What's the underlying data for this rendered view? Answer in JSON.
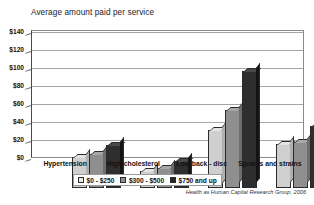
{
  "chart_data": {
    "type": "bar",
    "title": "Average amount paid per service",
    "xlabel": "",
    "ylabel": "",
    "ylim": [
      0,
      140
    ],
    "ytick_labels": [
      "$140",
      "$120",
      "$100",
      "$80",
      "$60",
      "$40",
      "$20",
      "$0"
    ],
    "ytick_values": [
      140,
      120,
      100,
      80,
      60,
      40,
      20,
      0
    ],
    "grid": true,
    "legend_position": "bottom",
    "categories": [
      "Hypertension",
      "High cholesterol",
      "Low back - disc",
      "Sprains and strains"
    ],
    "series": [
      {
        "name": "$0 - $250",
        "color": "#cfcfcf",
        "values": [
          35,
          19,
          65,
          49
        ]
      },
      {
        "name": "$300 - $500",
        "color": "#8f8f8f",
        "values": [
          38,
          22,
          87,
          51
        ]
      },
      {
        "name": "$750 and up",
        "color": "#2e2e2e",
        "values": [
          48,
          30,
          130,
          69
        ]
      }
    ],
    "source": "Health as Human Capital Research Group, 2006"
  },
  "legend": {
    "items": [
      {
        "label": "$0 - $250"
      },
      {
        "label": "$300 - $500"
      },
      {
        "label": "$750 and up"
      }
    ]
  }
}
